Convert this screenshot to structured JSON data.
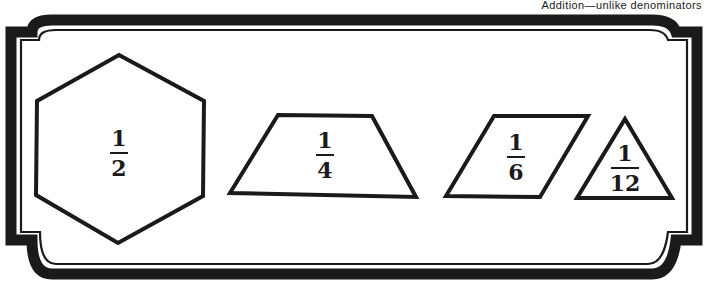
{
  "header": {
    "caption": "Addition—unlike denominators"
  },
  "frame": {
    "color": "#1a1a1a",
    "background": "#ffffff"
  },
  "shapes": [
    {
      "shape": "hexagon",
      "numerator": "1",
      "denominator": "2"
    },
    {
      "shape": "trapezoid",
      "numerator": "1",
      "denominator": "4"
    },
    {
      "shape": "parallelogram",
      "numerator": "1",
      "denominator": "6"
    },
    {
      "shape": "triangle",
      "numerator": "1",
      "denominator": "12"
    }
  ]
}
